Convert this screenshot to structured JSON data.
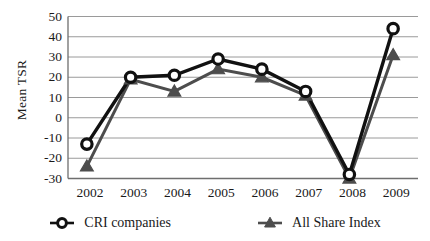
{
  "chart_data": {
    "type": "line",
    "title": "",
    "xlabel": "",
    "ylabel": "Mean TSR",
    "categories": [
      "2002",
      "2003",
      "2004",
      "2005",
      "2006",
      "2007",
      "2008",
      "2009"
    ],
    "x": [
      2002,
      2003,
      2004,
      2005,
      2006,
      2007,
      2008,
      2009
    ],
    "series": [
      {
        "name": "CRI companies",
        "marker": "circle",
        "color": "#111111",
        "values": [
          -13,
          20,
          21,
          29,
          24,
          13,
          -28,
          44
        ]
      },
      {
        "name": "All Share Index",
        "marker": "triangle",
        "color": "#4d4d4d",
        "values": [
          -24,
          19,
          13,
          24,
          20,
          11,
          -30,
          31
        ]
      }
    ],
    "ylim": [
      -30,
      50
    ],
    "yticks": [
      50,
      40,
      30,
      20,
      10,
      0,
      -10,
      -20,
      -30
    ],
    "ytick_labels": [
      "50",
      "40",
      "30",
      "20",
      "10",
      "0",
      "-10",
      "-20",
      "-30"
    ],
    "xtick_labels": [
      "2002",
      "2003",
      "2004",
      "2005",
      "2006",
      "2007",
      "2008",
      "2009"
    ],
    "grid": "horizontal",
    "legend_position": "bottom"
  },
  "axes": {
    "y_title": "Mean TSR"
  },
  "legend": {
    "entries": [
      {
        "label": "CRI companies",
        "marker_icon": "circle-marker-icon"
      },
      {
        "label": "All Share Index",
        "marker_icon": "triangle-marker-icon"
      }
    ]
  },
  "colors": {
    "series_primary": "#111111",
    "series_secondary": "#4d4d4d",
    "gridline": "#9a9a9a",
    "axis": "#6e6e6e",
    "background": "#ffffff"
  }
}
